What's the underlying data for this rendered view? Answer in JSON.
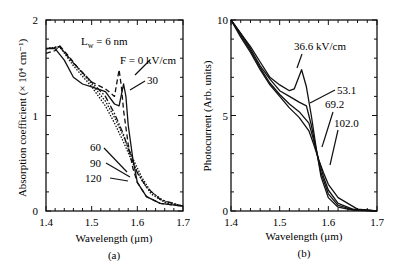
{
  "chart_data": [
    {
      "type": "line",
      "panel_label": "(a)",
      "title": "",
      "xlabel": "Wavelength (μm)",
      "ylabel": "Absorption coefficient (× 10⁴ cm⁻¹)",
      "xlim": [
        1.4,
        1.7
      ],
      "ylim": [
        0,
        2
      ],
      "xticks": [
        "1.4",
        "1.5",
        "1.6",
        "1.7"
      ],
      "yticks": [
        "0",
        "1",
        "2"
      ],
      "grid": false,
      "annotation": "L_w = 6 nm",
      "series": [
        {
          "name": "F = 0 kV/cm",
          "style": "dashed",
          "x": [
            1.4,
            1.42,
            1.43,
            1.45,
            1.47,
            1.5,
            1.53,
            1.55,
            1.56,
            1.565,
            1.57,
            1.58,
            1.59,
            1.6,
            1.62,
            1.65,
            1.7
          ],
          "y": [
            1.65,
            1.68,
            1.73,
            1.62,
            1.5,
            1.35,
            1.28,
            1.2,
            1.48,
            1.3,
            1.05,
            0.7,
            0.45,
            0.3,
            0.15,
            0.08,
            0.05
          ]
        },
        {
          "name": "30",
          "style": "solid",
          "x": [
            1.4,
            1.42,
            1.44,
            1.46,
            1.48,
            1.5,
            1.53,
            1.55,
            1.56,
            1.57,
            1.575,
            1.58,
            1.59,
            1.6,
            1.62,
            1.65,
            1.7
          ],
          "y": [
            1.7,
            1.7,
            1.58,
            1.4,
            1.33,
            1.3,
            1.25,
            1.12,
            1.1,
            1.33,
            1.2,
            0.9,
            0.55,
            0.3,
            0.15,
            0.08,
            0.05
          ]
        },
        {
          "name": "60",
          "style": "dash-dot",
          "x": [
            1.4,
            1.43,
            1.46,
            1.5,
            1.53,
            1.55,
            1.57,
            1.58,
            1.6,
            1.62,
            1.65,
            1.7
          ],
          "y": [
            1.7,
            1.72,
            1.55,
            1.35,
            1.2,
            1.02,
            0.8,
            0.65,
            0.4,
            0.25,
            0.12,
            0.05
          ]
        },
        {
          "name": "90",
          "style": "dotted",
          "x": [
            1.4,
            1.43,
            1.46,
            1.5,
            1.53,
            1.55,
            1.57,
            1.59,
            1.61,
            1.63,
            1.66,
            1.7
          ],
          "y": [
            1.7,
            1.72,
            1.55,
            1.33,
            1.15,
            0.98,
            0.78,
            0.55,
            0.35,
            0.2,
            0.1,
            0.05
          ]
        },
        {
          "name": "120",
          "style": "dotted",
          "x": [
            1.4,
            1.43,
            1.46,
            1.5,
            1.53,
            1.55,
            1.57,
            1.59,
            1.61,
            1.63,
            1.66,
            1.7
          ],
          "y": [
            1.7,
            1.72,
            1.52,
            1.3,
            1.1,
            0.92,
            0.72,
            0.5,
            0.32,
            0.18,
            0.09,
            0.05
          ]
        }
      ],
      "labels": [
        {
          "text": "F = 0 kV/cm",
          "x": 1.59,
          "y": 1.46
        },
        {
          "text": "30",
          "x": 1.65,
          "y": 1.3
        },
        {
          "text": "60",
          "x": 1.52,
          "y": 0.55
        },
        {
          "text": "90",
          "x": 1.52,
          "y": 0.38
        },
        {
          "text": "120",
          "x": 1.52,
          "y": 0.22
        }
      ]
    },
    {
      "type": "line",
      "panel_label": "(b)",
      "title": "",
      "xlabel": "Wavelength (μm)",
      "ylabel": "Photocurrent (Arb. units)",
      "xlim": [
        1.4,
        1.7
      ],
      "ylim": [
        0,
        10
      ],
      "xticks": [
        "1.4",
        "1.5",
        "1.6",
        "1.7"
      ],
      "yticks": [
        "0",
        "5",
        "10"
      ],
      "grid": false,
      "series": [
        {
          "name": "36.6 kV/cm",
          "x": [
            1.4,
            1.42,
            1.44,
            1.46,
            1.48,
            1.5,
            1.52,
            1.53,
            1.545,
            1.555,
            1.565,
            1.575,
            1.585,
            1.6,
            1.62,
            1.65,
            1.7
          ],
          "y": [
            10.0,
            9.3,
            8.6,
            7.8,
            7.0,
            6.6,
            6.3,
            6.4,
            7.4,
            6.5,
            5.0,
            3.3,
            1.8,
            0.7,
            0.2,
            0.05,
            0.0
          ]
        },
        {
          "name": "53.1",
          "x": [
            1.4,
            1.42,
            1.44,
            1.46,
            1.48,
            1.5,
            1.52,
            1.54,
            1.555,
            1.565,
            1.575,
            1.585,
            1.6,
            1.62,
            1.65,
            1.7
          ],
          "y": [
            10.0,
            9.3,
            8.5,
            7.6,
            6.9,
            6.3,
            6.0,
            5.7,
            5.5,
            4.5,
            3.2,
            2.0,
            0.9,
            0.3,
            0.08,
            0.0
          ]
        },
        {
          "name": "69.2",
          "x": [
            1.4,
            1.42,
            1.44,
            1.46,
            1.48,
            1.5,
            1.52,
            1.54,
            1.56,
            1.57,
            1.58,
            1.59,
            1.6,
            1.62,
            1.65,
            1.7
          ],
          "y": [
            10.0,
            9.2,
            8.4,
            7.5,
            6.7,
            6.1,
            5.6,
            5.2,
            4.6,
            3.7,
            2.7,
            1.8,
            1.1,
            0.4,
            0.1,
            0.0
          ]
        },
        {
          "name": "102.0",
          "x": [
            1.4,
            1.42,
            1.44,
            1.46,
            1.48,
            1.5,
            1.52,
            1.54,
            1.56,
            1.57,
            1.58,
            1.59,
            1.6,
            1.62,
            1.64,
            1.66,
            1.7
          ],
          "y": [
            10.0,
            9.1,
            8.3,
            7.4,
            6.6,
            6.0,
            5.4,
            4.9,
            4.2,
            3.5,
            2.7,
            2.0,
            1.4,
            0.7,
            0.4,
            0.1,
            0.0
          ]
        }
      ],
      "labels": [
        {
          "text": "36.6 kV/cm",
          "x": 1.52,
          "y": 8.9
        },
        {
          "text": "53.1",
          "x": 1.62,
          "y": 6.5
        },
        {
          "text": "69.2",
          "x": 1.6,
          "y": 5.7
        },
        {
          "text": "102.0",
          "x": 1.61,
          "y": 4.6
        }
      ]
    }
  ],
  "panels": {
    "a": {
      "ylabel": "Absorption coefficient (× 10⁴ cm⁻¹)",
      "xlabel": "Wavelength (μm)",
      "caption": "(a)",
      "lw_label": "L",
      "lw_sub": "w",
      "lw_rest": " = 6 nm",
      "ticks_x": [
        "1.4",
        "1.5",
        "1.6",
        "1.7"
      ],
      "ticks_y": [
        "0",
        "1",
        "2"
      ],
      "curve_labels": [
        "F = 0 kV/cm",
        "30",
        "60",
        "90",
        "120"
      ]
    },
    "b": {
      "ylabel": "Photocurrent (Arb. units)",
      "xlabel": "Wavelength (μm)",
      "caption": "(b)",
      "ticks_x": [
        "1.4",
        "1.5",
        "1.6",
        "1.7"
      ],
      "ticks_y": [
        "0",
        "5",
        "10"
      ],
      "curve_labels": [
        "36.6 kV/cm",
        "53.1",
        "69.2",
        "102.0"
      ]
    }
  }
}
